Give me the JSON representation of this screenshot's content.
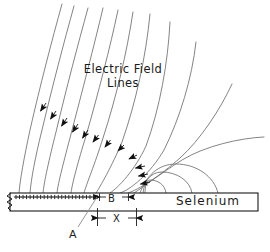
{
  "figure": {
    "title_text": "Electric Field Lines",
    "title_line1": "Electric Field",
    "title_line2": "Lines",
    "material_label": "Selenium",
    "labels": {
      "point_a": "A",
      "dimension_b": "B",
      "dimension_x": "X"
    },
    "surface_charge_symbol": "+",
    "surface_charge_count": 24,
    "colors": {
      "ink": "#1a1a1a",
      "field_line": "#6b6b6b",
      "background": "#ffffff"
    },
    "icons": {
      "arrowhead": "field-direction-arrowhead",
      "break": "zigzag-break-symbol"
    }
  },
  "chart_data": {
    "type": "line",
    "xlabel": "",
    "ylabel": "",
    "annotations": [
      {
        "name": "A",
        "meaning": "edge of charged region on selenium surface",
        "x": 96,
        "y": 196
      },
      {
        "name": "B",
        "meaning": "gap dimension at surface",
        "x": 112,
        "y": 197
      },
      {
        "name": "X",
        "meaning": "horizontal distance dimension",
        "x": 117,
        "y": 218
      },
      {
        "name": "Selenium",
        "meaning": "photoconductor layer",
        "x": 200,
        "y": 201
      }
    ],
    "series": [
      {
        "name": "field-line-1",
        "path": "M 62 4 C 52 40 40 86 30 130 C 24 158 20 180 19 193"
      },
      {
        "name": "field-line-2",
        "path": "M 74 6 C 64 42 52 88 42 130 C 35 158 31 180 30 193"
      },
      {
        "name": "field-line-3",
        "path": "M 88 8 C 78 44 66 90 56 132 C 49 160 44 182 43 193"
      },
      {
        "name": "field-line-4",
        "path": "M 103 8 C 94 46 82 92 71 134 C 64 161 58 183 57 193"
      },
      {
        "name": "field-line-5",
        "path": "M 118 10 C 110 48 98 94 86 136 C 78 162 72 184 71 193"
      },
      {
        "name": "field-line-6",
        "path": "M 133 12 C 127 52 116 98 103 138 C 95 164 86 185 84 193"
      },
      {
        "name": "field-line-7",
        "path": "M 150 14 C 146 56 136 102 122 142 C 112 166 100 187 96 193"
      },
      {
        "name": "field-line-8",
        "path": "M 170 22 C 168 62 160 108 146 146 C 135 170 118 188 110 193"
      },
      {
        "name": "field-line-9",
        "path": "M 196 42 C 192 78 180 118 164 150 C 150 174 130 190 120 193"
      },
      {
        "name": "field-line-10",
        "path": "M 232 84 C 220 110 200 140 180 158 C 160 176 138 190 128 193"
      },
      {
        "name": "field-line-11",
        "path": "M 264 137 C 240 138 205 146 182 160 C 160 174 142 188 134 193"
      },
      {
        "name": "field-line-12",
        "path": "M 218 193 C 214 176 196 164 176 164 C 158 164 146 176 140 193"
      },
      {
        "name": "field-line-13",
        "path": "M 192 193 C 190 180 176 172 162 172 C 150 172 144 182 143 193"
      },
      {
        "name": "field-line-14",
        "path": "M 166 193 C 165 184 157 180 150 180 C 146 180 145 188 145 193"
      }
    ],
    "arrow_markers": [
      {
        "x": 40,
        "y": 110,
        "angle": 250
      },
      {
        "x": 50,
        "y": 118,
        "angle": 252
      },
      {
        "x": 61,
        "y": 125,
        "angle": 253
      },
      {
        "x": 72,
        "y": 131,
        "angle": 255
      },
      {
        "x": 82,
        "y": 137,
        "angle": 256
      },
      {
        "x": 92,
        "y": 141,
        "angle": 258
      },
      {
        "x": 104,
        "y": 146,
        "angle": 260
      },
      {
        "x": 117,
        "y": 150,
        "angle": 264
      },
      {
        "x": 128,
        "y": 158,
        "angle": 272
      },
      {
        "x": 134,
        "y": 167,
        "angle": 280
      },
      {
        "x": 137,
        "y": 175,
        "angle": 283
      },
      {
        "x": 139,
        "y": 183,
        "angle": 285
      }
    ],
    "plate": {
      "x": 10,
      "y": 193,
      "width": 248,
      "height": 18
    },
    "grid": false,
    "legend": "none"
  }
}
